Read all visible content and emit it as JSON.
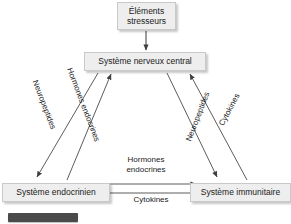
{
  "diagram": {
    "nodes": [
      {
        "id": "stressors",
        "label": "Éléments stresseurs"
      },
      {
        "id": "cns",
        "label": "Système nerveux central"
      },
      {
        "id": "endocrine",
        "label": "Système endocrinien"
      },
      {
        "id": "immune",
        "label": "Système immunitaire"
      }
    ],
    "edges": [
      {
        "id": "stressors-to-cns",
        "label": "",
        "from": "stressors",
        "to": "cns",
        "direction": "down"
      },
      {
        "id": "cns-to-endocrine",
        "label": "Neuropeptides",
        "from": "cns",
        "to": "endocrine",
        "direction": "down-left"
      },
      {
        "id": "endocrine-to-cns",
        "label": "Hormones endocrines",
        "from": "endocrine",
        "to": "cns",
        "direction": "up-right"
      },
      {
        "id": "cns-to-immune",
        "label": "Neuropeptides",
        "from": "cns",
        "to": "immune",
        "direction": "down-right"
      },
      {
        "id": "immune-to-cns",
        "label": "Cytokines",
        "from": "immune",
        "to": "cns",
        "direction": "up-left"
      },
      {
        "id": "endocrine-to-immune",
        "label": "Hormones endocrines",
        "from": "endocrine",
        "to": "immune",
        "direction": "right"
      },
      {
        "id": "immune-to-endocrine",
        "label": "Cytokines",
        "from": "immune",
        "to": "endocrine",
        "direction": "left"
      }
    ],
    "labels": {
      "hormones_mid_line1": "Hormones",
      "hormones_mid_line2": "endocrines",
      "cytokines_mid": "Cytokines"
    },
    "colors": {
      "background": "#ffffff",
      "node_fill": "#eeeeee",
      "node_border": "#c9c9c9",
      "line": "#4a4a4a",
      "text": "#1a1a1a",
      "footer_bar": "#4a4a4a"
    }
  }
}
